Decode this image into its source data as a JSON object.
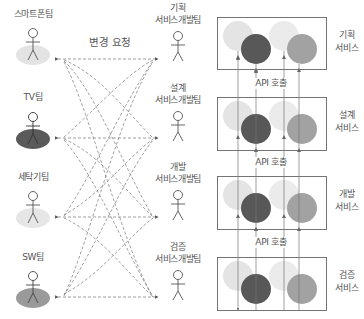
{
  "diagram": {
    "change_request_label": "변경 요청",
    "api_call_label": "API 호출",
    "left_teams": [
      {
        "name": "스마트폰팀",
        "ellipse_color": "#e3e3e3"
      },
      {
        "name": "TV팀",
        "ellipse_color": "#5a5a5a"
      },
      {
        "name": "세탁기팀",
        "ellipse_color": "#e6e6e6"
      },
      {
        "name": "SW팀",
        "ellipse_color": "#9a9a9a"
      }
    ],
    "dev_teams": [
      {
        "line1": "기획",
        "line2": "서비스개발팀"
      },
      {
        "line1": "설계",
        "line2": "서비스개발팀"
      },
      {
        "line1": "개발",
        "line2": "서비스개발팀"
      },
      {
        "line1": "검증",
        "line2": "서비스개발팀"
      }
    ],
    "services": [
      {
        "line1": "기획",
        "line2": "서비스"
      },
      {
        "line1": "설계",
        "line2": "서비스"
      },
      {
        "line1": "개발",
        "line2": "서비스"
      },
      {
        "line1": "검증",
        "line2": "서비스"
      }
    ],
    "circle_colors": {
      "light1": "#e4e4e4",
      "dark": "#585858",
      "light2": "#ebebeb",
      "mid": "#a2a2a2"
    },
    "line_color": "#777777",
    "box_border_color": "#666666"
  }
}
